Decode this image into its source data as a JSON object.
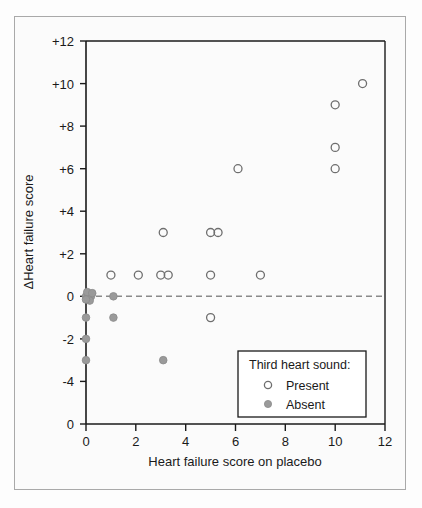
{
  "chart_data": {
    "type": "scatter",
    "title": "",
    "xlabel": "Heart failure score on placebo",
    "ylabel": "ΔHeart failure score",
    "xlim": [
      0,
      12
    ],
    "ylim": [
      -6,
      12
    ],
    "xticks": [
      "0",
      "2",
      "4",
      "6",
      "8",
      "10",
      "12"
    ],
    "xtick_values": [
      0,
      2,
      4,
      6,
      8,
      10,
      12
    ],
    "yticks": [
      "+12",
      "+10",
      "+8",
      "+6",
      "+4",
      "+2",
      "0",
      "-2",
      "-4",
      "0"
    ],
    "ytick_values": [
      12,
      10,
      8,
      6,
      4,
      2,
      0,
      -2,
      -4,
      -6
    ],
    "grid": false,
    "reference_line": {
      "y": 0,
      "style": "dashed",
      "color": "#8a8a8a"
    },
    "legend": {
      "position": "lower-right",
      "title": "Third heart sound:",
      "entries": [
        {
          "label": "Present",
          "marker": "open-circle",
          "color": "#6e6e6e"
        },
        {
          "label": "Absent",
          "marker": "filled-circle",
          "color": "#9a9a9a"
        }
      ]
    },
    "series": [
      {
        "name": "Present",
        "marker": "open-circle",
        "color": "#6e6e6e",
        "points": [
          [
            1.0,
            1
          ],
          [
            2.1,
            1
          ],
          [
            3.0,
            1
          ],
          [
            3.3,
            1
          ],
          [
            5.0,
            1
          ],
          [
            7.0,
            1
          ],
          [
            3.1,
            3
          ],
          [
            5.0,
            3
          ],
          [
            5.3,
            3
          ],
          [
            6.1,
            6
          ],
          [
            10.0,
            6
          ],
          [
            10.0,
            7
          ],
          [
            10.0,
            9
          ],
          [
            11.1,
            10
          ],
          [
            5.0,
            -1
          ]
        ]
      },
      {
        "name": "Absent",
        "marker": "filled-circle",
        "color": "#9a9a9a",
        "points": [
          [
            0.0,
            0
          ],
          [
            0.1,
            0
          ],
          [
            0.2,
            0
          ],
          [
            0.05,
            0.2
          ],
          [
            0.25,
            0.15
          ],
          [
            0.15,
            -0.2
          ],
          [
            0.0,
            -0.15
          ],
          [
            1.1,
            0
          ],
          [
            0.0,
            -1
          ],
          [
            1.1,
            -1
          ],
          [
            0.0,
            -2
          ],
          [
            0.0,
            -3
          ],
          [
            3.1,
            -3
          ]
        ]
      }
    ]
  },
  "axis": {
    "x_title": "Heart failure score on placebo",
    "y_title": "ΔHeart failure score"
  },
  "legend": {
    "title": "Third heart sound:",
    "present_label": "Present",
    "absent_label": "Absent"
  },
  "colors": {
    "open_marker": "#6e6e6e",
    "filled_marker": "#9a9a9a",
    "axis": "#1a1a1a",
    "reference_line": "#8a8a8a",
    "frame": "#a9a9a9",
    "background": "#fbfbfb"
  }
}
